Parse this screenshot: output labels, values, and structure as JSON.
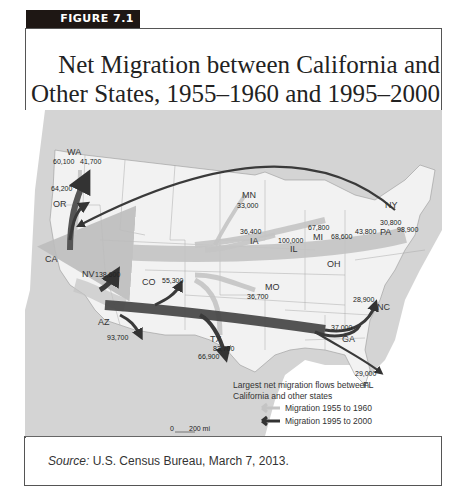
{
  "figure": {
    "tag": "FIGURE 7.1",
    "title_line1": "Net Migration between California and",
    "title_line2": "Other States, 1955–1960 and 1995–2000"
  },
  "map": {
    "origin_state": "CA",
    "state_labels": [
      "WA",
      "OR",
      "CA",
      "NV",
      "AZ",
      "CO",
      "TX",
      "MN",
      "IA",
      "IL",
      "MO",
      "MI",
      "OH",
      "PA",
      "NY",
      "NC",
      "GA",
      "FL"
    ],
    "flows": [
      {
        "state": "WA",
        "period": "1995-2000",
        "value": "60,100"
      },
      {
        "state": "WA",
        "period": "1955-1960",
        "value": "41,700"
      },
      {
        "state": "OR",
        "period": "1995-2000",
        "value": "64,200"
      },
      {
        "state": "NV",
        "period": "1995-2000",
        "value": "138,600"
      },
      {
        "state": "AZ",
        "period": "1995-2000",
        "value": "93,700"
      },
      {
        "state": "CO",
        "period": "1995-2000",
        "value": "55,300"
      },
      {
        "state": "TX",
        "period": "1995-2000",
        "value": "66,900"
      },
      {
        "state": "TX",
        "period": "1955-1960",
        "value": "83,700"
      },
      {
        "state": "MN",
        "period": "1955-1960",
        "value": "33,000"
      },
      {
        "state": "IA",
        "period": "1955-1960",
        "value": "36,400"
      },
      {
        "state": "IL",
        "period": "1955-1960",
        "value": "100,000"
      },
      {
        "state": "MO",
        "period": "1955-1960",
        "value": "36,700"
      },
      {
        "state": "MI",
        "period": "1955-1960",
        "value": "67,800"
      },
      {
        "state": "OH",
        "period": "1955-1960",
        "value": "68,600"
      },
      {
        "state": "PA",
        "period": "1955-1960",
        "value": "43,800"
      },
      {
        "state": "NY",
        "period": "1995-2000",
        "value": "30,800"
      },
      {
        "state": "NY",
        "period": "1955-1960",
        "value": "98,900"
      },
      {
        "state": "NC",
        "period": "1995-2000",
        "value": "28,900"
      },
      {
        "state": "GA",
        "period": "1995-2000",
        "value": "37,000"
      },
      {
        "state": "FL",
        "period": "1995-2000",
        "value": "29,000"
      }
    ],
    "legend": {
      "title_line1": "Largest net migration flows between",
      "title_line2": "California and other states",
      "items": [
        {
          "label": "Migration 1955 to 1960",
          "color": "#bdbdbd"
        },
        {
          "label": "Migration 1995 to 2000",
          "color": "#3a3a3a"
        }
      ]
    },
    "scale": {
      "zero": "0",
      "distance": "200 mi"
    }
  },
  "source": {
    "prefix": "Source:",
    "text": " U.S. Census Bureau, March 7, 2013."
  }
}
